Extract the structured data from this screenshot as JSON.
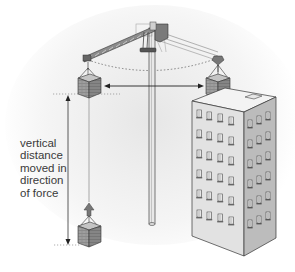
{
  "diagram": {
    "label_lines": [
      "vertical",
      "distance",
      "moved in",
      "direction",
      "of force"
    ],
    "elements": {
      "crane": "tower crane with rotating jib",
      "load_top_left": "brick crate raised to top (left position)",
      "load_top_right": "brick crate swung over building (right position)",
      "load_bottom": "brick crate at ground level",
      "building": "multi-storey office building",
      "horizontal_arrow": "double-headed horizontal arrow between raised loads",
      "vertical_arrow": "double-headed vertical arrow showing height lifted",
      "swing_path": "dotted arc traced by the jib tip"
    },
    "colors": {
      "line": "#333333",
      "crate": "#9a9a9a",
      "crate_top": "#c8c8c8",
      "building_front": "#e4e4e4",
      "building_side": "#bdbdbd",
      "building_roof": "#f2f2f2",
      "shadow_gradient": "#dcdcdc",
      "text": "#3a3a3a"
    }
  }
}
